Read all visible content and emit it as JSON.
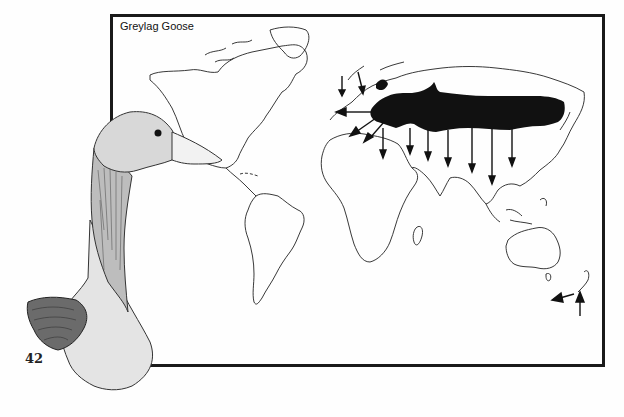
{
  "page": {
    "map_title": "Greylag Goose",
    "page_number": "42"
  },
  "map": {
    "subject": "Greylag Goose",
    "range_color": "#111111",
    "outline_color": "#222222",
    "arrows_description": "migration arrows pointing south from breeding range; introduced population arrows in New Zealand",
    "regions": [
      "North America",
      "South America",
      "Europe",
      "Africa",
      "Asia",
      "Australia",
      "New Zealand"
    ]
  },
  "illustration": {
    "subject": "Greylag Goose head and neck drawing"
  }
}
